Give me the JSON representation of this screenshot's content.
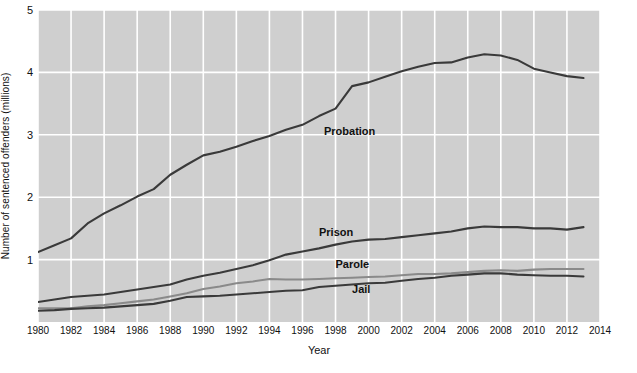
{
  "chart_data": {
    "type": "line",
    "title": "",
    "xlabel": "Year",
    "ylabel": "Number of sentenced offenders (millions)",
    "xlim": [
      1980,
      2014
    ],
    "ylim": [
      0,
      5
    ],
    "yticks": [
      0,
      1,
      2,
      3,
      4,
      5
    ],
    "ytick_labels": [
      "",
      "1",
      "2",
      "3",
      "4",
      "5"
    ],
    "xticks": [
      1980,
      1982,
      1984,
      1986,
      1988,
      1990,
      1992,
      1994,
      1996,
      1998,
      2000,
      2002,
      2004,
      2006,
      2008,
      2010,
      2012,
      2014
    ],
    "xtick_labels": [
      "1980",
      "1982",
      "1984",
      "1986",
      "1988",
      "1990",
      "1992",
      "1994",
      "1996",
      "1998",
      "2000",
      "2002",
      "2004",
      "2006",
      "2008",
      "2010",
      "2012",
      "2014"
    ],
    "grid": true,
    "grid_color": "#ffffff",
    "plot_background": "#cfcfcf",
    "legend": "inline-labels",
    "x": [
      1980,
      1981,
      1982,
      1983,
      1984,
      1985,
      1986,
      1987,
      1988,
      1989,
      1990,
      1991,
      1992,
      1993,
      1994,
      1995,
      1996,
      1997,
      1998,
      1999,
      2000,
      2001,
      2002,
      2003,
      2004,
      2005,
      2006,
      2007,
      2008,
      2009,
      2010,
      2011,
      2012,
      2013
    ],
    "series": [
      {
        "name": "Probation",
        "color": "#3a3a3a",
        "values": [
          1.12,
          1.23,
          1.34,
          1.58,
          1.74,
          1.87,
          2.01,
          2.13,
          2.36,
          2.52,
          2.67,
          2.73,
          2.81,
          2.9,
          2.98,
          3.08,
          3.16,
          3.3,
          3.42,
          3.78,
          3.84,
          3.93,
          4.02,
          4.09,
          4.15,
          4.16,
          4.24,
          4.29,
          4.27,
          4.2,
          4.06,
          4.0,
          3.94,
          3.91
        ],
        "label_x": 1997.3,
        "label_y": 3.05
      },
      {
        "name": "Prison",
        "color": "#3a3a3a",
        "values": [
          0.32,
          0.36,
          0.4,
          0.42,
          0.44,
          0.48,
          0.52,
          0.56,
          0.6,
          0.68,
          0.74,
          0.79,
          0.85,
          0.91,
          0.99,
          1.08,
          1.13,
          1.18,
          1.24,
          1.29,
          1.32,
          1.33,
          1.36,
          1.39,
          1.42,
          1.45,
          1.5,
          1.53,
          1.52,
          1.52,
          1.5,
          1.5,
          1.48,
          1.52
        ],
        "label_x": 1997.0,
        "label_y": 1.42
      },
      {
        "name": "Parole",
        "color": "#8a8a8a",
        "values": [
          0.22,
          0.22,
          0.22,
          0.25,
          0.27,
          0.3,
          0.33,
          0.36,
          0.41,
          0.46,
          0.53,
          0.57,
          0.62,
          0.65,
          0.69,
          0.68,
          0.68,
          0.69,
          0.7,
          0.71,
          0.72,
          0.73,
          0.75,
          0.77,
          0.77,
          0.78,
          0.8,
          0.82,
          0.83,
          0.82,
          0.84,
          0.85,
          0.85,
          0.85
        ],
        "label_x": 1998.0,
        "label_y": 0.92
      },
      {
        "name": "Jail",
        "color": "#3a3a3a",
        "values": [
          0.18,
          0.19,
          0.21,
          0.22,
          0.23,
          0.25,
          0.27,
          0.29,
          0.34,
          0.4,
          0.41,
          0.42,
          0.44,
          0.46,
          0.48,
          0.5,
          0.51,
          0.56,
          0.58,
          0.6,
          0.62,
          0.63,
          0.66,
          0.69,
          0.71,
          0.74,
          0.76,
          0.78,
          0.78,
          0.76,
          0.75,
          0.74,
          0.74,
          0.73
        ],
        "label_x": 1999.0,
        "label_y": 0.52
      }
    ]
  }
}
